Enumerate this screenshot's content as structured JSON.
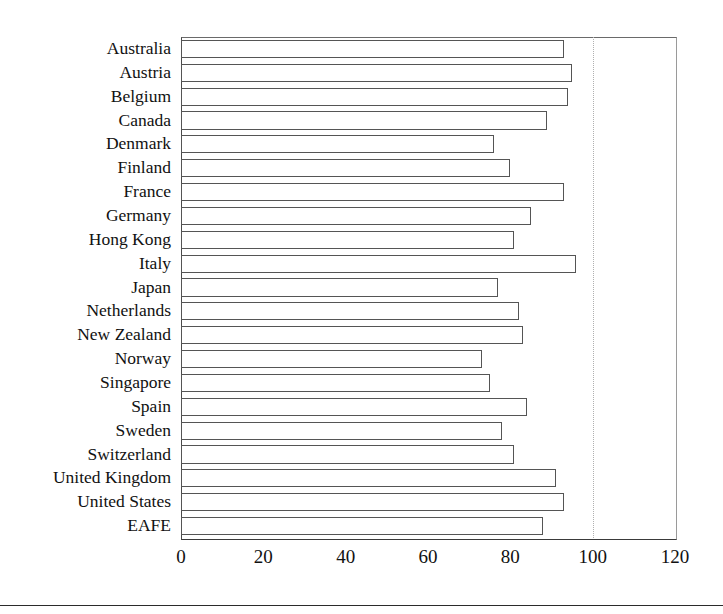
{
  "chart_data": {
    "type": "bar",
    "orientation": "horizontal",
    "title": "",
    "subtitle": "",
    "xlabel": "",
    "ylabel": "",
    "xlim": [
      0,
      120
    ],
    "ylim": null,
    "grid": "dotted vertical gridline at 100",
    "legend": null,
    "legend_position": "none",
    "xticks": [
      0,
      20,
      40,
      60,
      80,
      100,
      120
    ],
    "xtick_labels": [
      "0",
      "20",
      "40",
      "60",
      "80",
      "100",
      "120"
    ],
    "gridlines": [
      100
    ],
    "bar_style": {
      "fill": "#ffffff",
      "edge": "#555555"
    },
    "categories": [
      "Australia",
      "Austria",
      "Belgium",
      "Canada",
      "Denmark",
      "Finland",
      "France",
      "Germany",
      "Hong Kong",
      "Italy",
      "Japan",
      "Netherlands",
      "New Zealand",
      "Norway",
      "Singapore",
      "Spain",
      "Sweden",
      "Switzerland",
      "United Kingdom",
      "United States",
      "EAFE"
    ],
    "values": [
      93,
      95,
      94,
      89,
      76,
      80,
      93,
      85,
      81,
      96,
      77,
      82,
      83,
      73,
      75,
      84,
      78,
      81,
      91,
      93,
      88
    ]
  }
}
